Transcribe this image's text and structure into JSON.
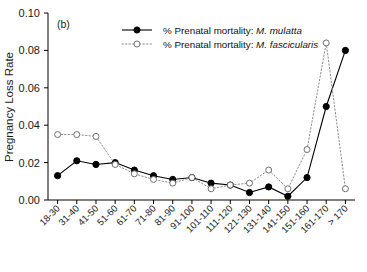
{
  "panel": {
    "label": "(b)"
  },
  "axes": {
    "ylabel": "Pregnancy Loss Rate",
    "yticks": [
      "0.00",
      "0.02",
      "0.04",
      "0.06",
      "0.08",
      "0.10"
    ],
    "xlabel": ""
  },
  "legend": {
    "items": [
      {
        "prefix": "% Prenatal mortality: ",
        "species": "M. mulatta",
        "marker": "filled-circle-solid-line"
      },
      {
        "prefix": "% Prenatal mortality: ",
        "species": "M. fascicularis",
        "marker": "open-circle-dotted-line"
      }
    ]
  },
  "chart_data": {
    "type": "line",
    "title": "",
    "subtitle": "(b)",
    "xlabel": "",
    "ylabel": "Pregnancy Loss Rate",
    "ylim": [
      0.0,
      0.1
    ],
    "yticks": [
      0.0,
      0.02,
      0.04,
      0.06,
      0.08,
      0.1
    ],
    "grid": false,
    "legend_position": "top-center",
    "categories": [
      "18-30",
      "31-40",
      "41-50",
      "51-60",
      "61-70",
      "71-80",
      "81-90",
      "91-100",
      "101-110",
      "111-120",
      "121-130",
      "131-140",
      "141-150",
      "151-160",
      "161-170",
      "> 170"
    ],
    "series": [
      {
        "name": "% Prenatal mortality: M. mulatta",
        "marker": "filled-circle",
        "linestyle": "solid",
        "color": "#000000",
        "values": [
          0.013,
          0.021,
          0.019,
          0.02,
          0.016,
          0.013,
          0.011,
          0.012,
          0.009,
          0.008,
          0.004,
          0.007,
          0.002,
          0.012,
          0.05,
          0.08
        ]
      },
      {
        "name": "% Prenatal mortality: M. fascicularis",
        "marker": "open-circle",
        "linestyle": "dotted",
        "color": "#8a8a8a",
        "values": [
          0.035,
          0.035,
          0.034,
          0.019,
          0.014,
          0.011,
          0.009,
          0.012,
          0.006,
          0.008,
          0.009,
          0.016,
          0.006,
          0.027,
          0.084,
          0.006
        ]
      }
    ]
  }
}
